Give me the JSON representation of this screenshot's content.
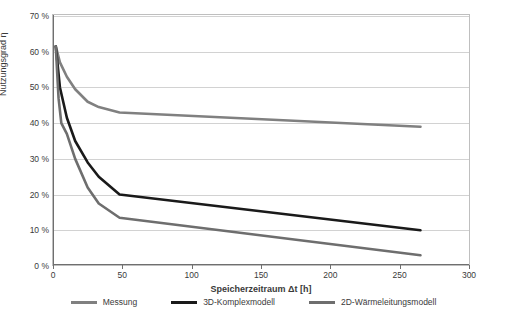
{
  "chart_data": {
    "type": "line",
    "title": "",
    "xlabel": "Speicherzeitraum Δt [h]",
    "ylabel": "Nutzungsgrad η",
    "xlim": [
      0,
      300
    ],
    "ylim": [
      0,
      70
    ],
    "grid": true,
    "legend_position": "bottom",
    "xticks": [
      "0",
      "50",
      "100",
      "150",
      "200",
      "250",
      "300"
    ],
    "xtick_values": [
      0,
      50,
      100,
      150,
      200,
      250,
      300
    ],
    "yticks": [
      "0 %",
      "10 %",
      "20 %",
      "30 %",
      "40 %",
      "50 %",
      "60 %",
      "70 %"
    ],
    "ytick_values": [
      0,
      10,
      20,
      30,
      40,
      50,
      60,
      70
    ],
    "series": [
      {
        "name": "Messung",
        "color": "#808080",
        "width": 2.6,
        "points": [
          [
            2,
            61.5
          ],
          [
            5,
            57.0
          ],
          [
            10,
            53.0
          ],
          [
            16,
            49.5
          ],
          [
            25,
            46.0
          ],
          [
            33,
            44.5
          ],
          [
            48,
            43.0
          ],
          [
            265,
            39.0
          ]
        ]
      },
      {
        "name": "3D-Komplexmodell",
        "color": "#1a1a1a",
        "width": 2.6,
        "points": [
          [
            2,
            61.5
          ],
          [
            5,
            50.0
          ],
          [
            10,
            41.5
          ],
          [
            16,
            35.0
          ],
          [
            25,
            29.0
          ],
          [
            33,
            25.0
          ],
          [
            48,
            20.0
          ],
          [
            265,
            10.0
          ]
        ]
      },
      {
        "name": "2D-Wärmeleitungsmodell",
        "color": "#6e6e6e",
        "width": 2.6,
        "points": [
          [
            2,
            61.5
          ],
          [
            4,
            47.0
          ],
          [
            6,
            40.0
          ],
          [
            10,
            37.0
          ],
          [
            16,
            30.0
          ],
          [
            25,
            22.0
          ],
          [
            33,
            17.5
          ],
          [
            48,
            13.5
          ],
          [
            265,
            3.0
          ]
        ]
      }
    ]
  },
  "legend": [
    {
      "label": "Messung",
      "color": "#808080"
    },
    {
      "label": "3D-Komplexmodell",
      "color": "#1a1a1a"
    },
    {
      "label": "2D-Wärmeleitungsmodell",
      "color": "#6e6e6e"
    }
  ]
}
